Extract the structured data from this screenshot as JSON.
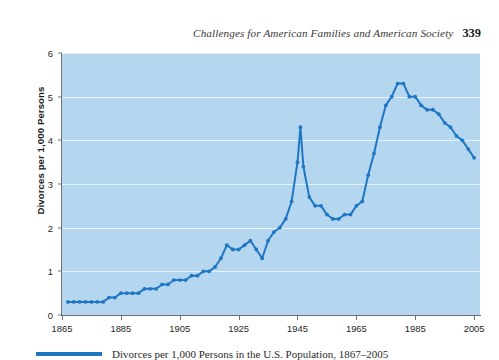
{
  "running_head": {
    "title": "Challenges for American Families and American Society",
    "page_number": "339"
  },
  "caption": {
    "legend_label": "Divorces per 1,000 Persons in the U.S. Population, 1867–2005"
  },
  "chart_data": {
    "type": "line",
    "title": "",
    "xlabel": "",
    "ylabel": "Divorces per 1,000 Persons",
    "xlim": [
      1865,
      2007
    ],
    "ylim": [
      0,
      6
    ],
    "grid": true,
    "legend": "none",
    "line_color": "#1f77c4",
    "plot_background": "#b4d6ef",
    "gridline_color": "#e8f2fb",
    "xticks": [
      1865,
      1885,
      1905,
      1925,
      1945,
      1965,
      1985,
      2005
    ],
    "yticks": [
      0,
      1,
      2,
      3,
      4,
      5,
      6
    ],
    "series": [
      {
        "name": "Divorces per 1,000 Persons",
        "x": [
          1867,
          1869,
          1871,
          1873,
          1875,
          1877,
          1879,
          1881,
          1883,
          1885,
          1887,
          1889,
          1891,
          1893,
          1895,
          1897,
          1899,
          1901,
          1903,
          1905,
          1907,
          1909,
          1911,
          1913,
          1915,
          1917,
          1919,
          1921,
          1923,
          1925,
          1927,
          1929,
          1931,
          1933,
          1935,
          1937,
          1939,
          1941,
          1943,
          1945,
          1946,
          1947,
          1949,
          1951,
          1953,
          1955,
          1957,
          1959,
          1961,
          1963,
          1965,
          1967,
          1969,
          1971,
          1973,
          1975,
          1977,
          1979,
          1981,
          1983,
          1985,
          1987,
          1989,
          1991,
          1993,
          1995,
          1997,
          1999,
          2001,
          2003,
          2005
        ],
        "y": [
          0.3,
          0.3,
          0.3,
          0.3,
          0.3,
          0.3,
          0.3,
          0.4,
          0.4,
          0.5,
          0.5,
          0.5,
          0.5,
          0.6,
          0.6,
          0.6,
          0.7,
          0.7,
          0.8,
          0.8,
          0.8,
          0.9,
          0.9,
          1.0,
          1.0,
          1.1,
          1.3,
          1.6,
          1.5,
          1.5,
          1.6,
          1.7,
          1.5,
          1.3,
          1.7,
          1.9,
          2.0,
          2.2,
          2.6,
          3.5,
          4.3,
          3.4,
          2.7,
          2.5,
          2.5,
          2.3,
          2.2,
          2.2,
          2.3,
          2.3,
          2.5,
          2.6,
          3.2,
          3.7,
          4.3,
          4.8,
          5.0,
          5.3,
          5.3,
          5.0,
          5.0,
          4.8,
          4.7,
          4.7,
          4.6,
          4.4,
          4.3,
          4.1,
          4.0,
          3.8,
          3.6
        ]
      }
    ]
  }
}
